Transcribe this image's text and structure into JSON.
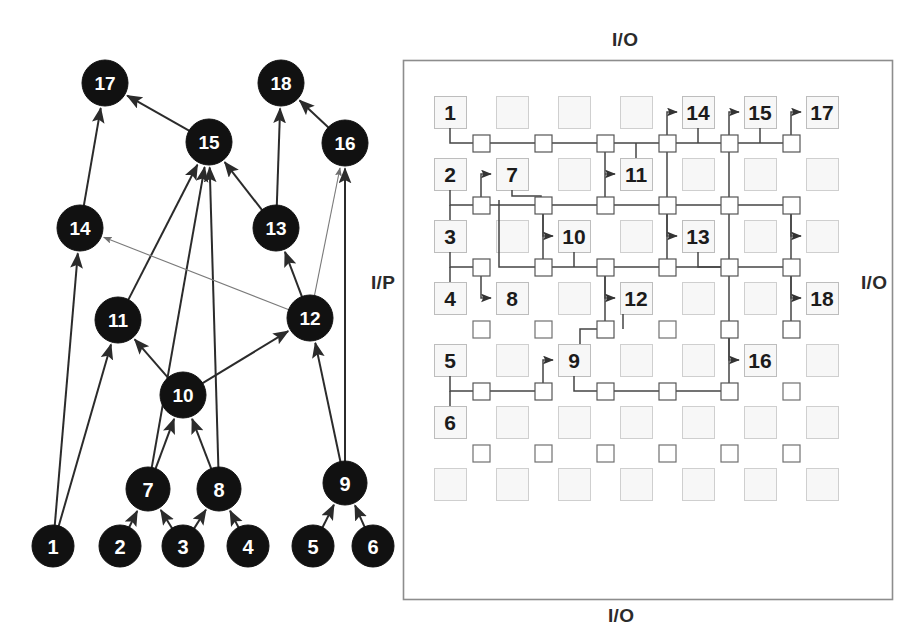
{
  "figure": {
    "width": 914,
    "height": 641,
    "background": "#ffffff"
  },
  "left_panel": {
    "name": "task-graph",
    "node_fill": "#111111",
    "node_text_color": "#ffffff",
    "edge_color": "#2b2b2b",
    "side_label": "I/P",
    "nodes": [
      {
        "id": "1",
        "label": "1",
        "cx": 53,
        "cy": 546,
        "r": 21
      },
      {
        "id": "2",
        "label": "2",
        "cx": 120,
        "cy": 546,
        "r": 21
      },
      {
        "id": "3",
        "label": "3",
        "cx": 183,
        "cy": 546,
        "r": 21
      },
      {
        "id": "4",
        "label": "4",
        "cx": 248,
        "cy": 546,
        "r": 21
      },
      {
        "id": "5",
        "label": "5",
        "cx": 313,
        "cy": 546,
        "r": 21
      },
      {
        "id": "6",
        "label": "6",
        "cx": 373,
        "cy": 546,
        "r": 21
      },
      {
        "id": "7",
        "label": "7",
        "cx": 148,
        "cy": 489,
        "r": 22
      },
      {
        "id": "8",
        "label": "8",
        "cx": 219,
        "cy": 489,
        "r": 22
      },
      {
        "id": "9",
        "label": "9",
        "cx": 345,
        "cy": 483,
        "r": 22
      },
      {
        "id": "10",
        "label": "10",
        "cx": 183,
        "cy": 395,
        "r": 23
      },
      {
        "id": "11",
        "label": "11",
        "cx": 118,
        "cy": 320,
        "r": 23
      },
      {
        "id": "12",
        "label": "12",
        "cx": 310,
        "cy": 318,
        "r": 23
      },
      {
        "id": "13",
        "label": "13",
        "cx": 276,
        "cy": 228,
        "r": 23
      },
      {
        "id": "14",
        "label": "14",
        "cx": 80,
        "cy": 228,
        "r": 23
      },
      {
        "id": "15",
        "label": "15",
        "cx": 209,
        "cy": 142,
        "r": 23
      },
      {
        "id": "16",
        "label": "16",
        "cx": 345,
        "cy": 143,
        "r": 23
      },
      {
        "id": "17",
        "label": "17",
        "cx": 105,
        "cy": 83,
        "r": 23
      },
      {
        "id": "18",
        "label": "18",
        "cx": 281,
        "cy": 83,
        "r": 23
      }
    ],
    "edges": [
      {
        "from": "1",
        "to": "11"
      },
      {
        "from": "1",
        "to": "14"
      },
      {
        "from": "2",
        "to": "7"
      },
      {
        "from": "3",
        "to": "7"
      },
      {
        "from": "3",
        "to": "8"
      },
      {
        "from": "4",
        "to": "8"
      },
      {
        "from": "5",
        "to": "9"
      },
      {
        "from": "6",
        "to": "9"
      },
      {
        "from": "7",
        "to": "10"
      },
      {
        "from": "7",
        "to": "15"
      },
      {
        "from": "8",
        "to": "10"
      },
      {
        "from": "8",
        "to": "15"
      },
      {
        "from": "9",
        "to": "12"
      },
      {
        "from": "9",
        "to": "16"
      },
      {
        "from": "10",
        "to": "11"
      },
      {
        "from": "10",
        "to": "12"
      },
      {
        "from": "11",
        "to": "15"
      },
      {
        "from": "12",
        "to": "13"
      },
      {
        "from": "12",
        "to": "14"
      },
      {
        "from": "12",
        "to": "16"
      },
      {
        "from": "13",
        "to": "15"
      },
      {
        "from": "13",
        "to": "18"
      },
      {
        "from": "14",
        "to": "17"
      },
      {
        "from": "15",
        "to": "17"
      },
      {
        "from": "16",
        "to": "18"
      }
    ]
  },
  "right_panel": {
    "name": "fpga-placement-grid",
    "border_color": "#8d8d8d",
    "block_border": "#cfcfcf",
    "block_fill": "#f7f7f7",
    "switch_border": "#555555",
    "wire_color": "#444444",
    "labels": {
      "top": "I/O",
      "right": "I/O",
      "bottom": "I/O"
    },
    "frame": {
      "x": 403,
      "y": 60,
      "w": 490,
      "h": 540
    },
    "geometry": {
      "cols": 7,
      "rows": 7,
      "block_size": 32,
      "switch_size": 17,
      "pitch_x": 62,
      "pitch_y": 62,
      "origin_x": 434,
      "origin_y": 96
    },
    "blocks": [
      {
        "col": 1,
        "row": 1,
        "label": "1"
      },
      {
        "col": 2,
        "row": 1,
        "label": ""
      },
      {
        "col": 3,
        "row": 1,
        "label": ""
      },
      {
        "col": 4,
        "row": 1,
        "label": ""
      },
      {
        "col": 5,
        "row": 1,
        "label": "14"
      },
      {
        "col": 6,
        "row": 1,
        "label": "15"
      },
      {
        "col": 7,
        "row": 1,
        "label": "17"
      },
      {
        "col": 1,
        "row": 2,
        "label": "2"
      },
      {
        "col": 2,
        "row": 2,
        "label": "7"
      },
      {
        "col": 3,
        "row": 2,
        "label": ""
      },
      {
        "col": 4,
        "row": 2,
        "label": "11"
      },
      {
        "col": 5,
        "row": 2,
        "label": ""
      },
      {
        "col": 6,
        "row": 2,
        "label": ""
      },
      {
        "col": 7,
        "row": 2,
        "label": ""
      },
      {
        "col": 1,
        "row": 3,
        "label": "3"
      },
      {
        "col": 2,
        "row": 3,
        "label": ""
      },
      {
        "col": 3,
        "row": 3,
        "label": "10"
      },
      {
        "col": 4,
        "row": 3,
        "label": ""
      },
      {
        "col": 5,
        "row": 3,
        "label": "13"
      },
      {
        "col": 6,
        "row": 3,
        "label": ""
      },
      {
        "col": 7,
        "row": 3,
        "label": ""
      },
      {
        "col": 1,
        "row": 4,
        "label": "4"
      },
      {
        "col": 2,
        "row": 4,
        "label": "8"
      },
      {
        "col": 3,
        "row": 4,
        "label": ""
      },
      {
        "col": 4,
        "row": 4,
        "label": "12"
      },
      {
        "col": 5,
        "row": 4,
        "label": ""
      },
      {
        "col": 6,
        "row": 4,
        "label": ""
      },
      {
        "col": 7,
        "row": 4,
        "label": "18"
      },
      {
        "col": 1,
        "row": 5,
        "label": "5"
      },
      {
        "col": 2,
        "row": 5,
        "label": ""
      },
      {
        "col": 3,
        "row": 5,
        "label": "9"
      },
      {
        "col": 4,
        "row": 5,
        "label": ""
      },
      {
        "col": 5,
        "row": 5,
        "label": ""
      },
      {
        "col": 6,
        "row": 5,
        "label": "16"
      },
      {
        "col": 7,
        "row": 5,
        "label": ""
      },
      {
        "col": 1,
        "row": 6,
        "label": "6"
      },
      {
        "col": 2,
        "row": 6,
        "label": ""
      },
      {
        "col": 3,
        "row": 6,
        "label": ""
      },
      {
        "col": 4,
        "row": 6,
        "label": ""
      },
      {
        "col": 5,
        "row": 6,
        "label": ""
      },
      {
        "col": 6,
        "row": 6,
        "label": ""
      },
      {
        "col": 7,
        "row": 6,
        "label": ""
      },
      {
        "col": 1,
        "row": 7,
        "label": ""
      },
      {
        "col": 2,
        "row": 7,
        "label": ""
      },
      {
        "col": 3,
        "row": 7,
        "label": ""
      },
      {
        "col": 4,
        "row": 7,
        "label": ""
      },
      {
        "col": 5,
        "row": 7,
        "label": ""
      },
      {
        "col": 6,
        "row": 7,
        "label": ""
      },
      {
        "col": 7,
        "row": 7,
        "label": ""
      }
    ],
    "switch_rows": [
      {
        "row": 1,
        "cols": [
          1,
          2,
          3,
          4,
          5,
          6
        ],
        "active": [
          1,
          2,
          3,
          4,
          5,
          6
        ]
      },
      {
        "row": 2,
        "cols": [
          1,
          2,
          3,
          4,
          5,
          6
        ],
        "active": [
          1,
          2,
          3,
          4,
          5,
          6
        ]
      },
      {
        "row": 3,
        "cols": [
          1,
          2,
          3,
          4,
          5,
          6
        ],
        "active": [
          1,
          2,
          3,
          4,
          5,
          6
        ]
      },
      {
        "row": 4,
        "cols": [
          1,
          2,
          3,
          4,
          5,
          6
        ],
        "active": [
          3,
          5,
          6
        ]
      },
      {
        "row": 5,
        "cols": [
          1,
          2,
          3,
          4,
          5,
          6
        ],
        "active": [
          1,
          2,
          3,
          4,
          5
        ]
      },
      {
        "row": 6,
        "cols": [
          1,
          2,
          3,
          4,
          5,
          6
        ],
        "active": []
      }
    ],
    "nets": [
      {
        "source": "1",
        "sink": "14"
      },
      {
        "source": "1",
        "sink": "11"
      },
      {
        "source": "2",
        "sink": "7"
      },
      {
        "source": "3",
        "sink": "8"
      },
      {
        "source": "7",
        "sink": "10"
      },
      {
        "source": "10",
        "sink": "12"
      },
      {
        "source": "12",
        "sink": "9"
      },
      {
        "source": "9",
        "sink": "16"
      },
      {
        "source": "13",
        "sink": "15"
      },
      {
        "source": "13",
        "sink": "18"
      },
      {
        "source": "15",
        "sink": "17"
      }
    ]
  }
}
